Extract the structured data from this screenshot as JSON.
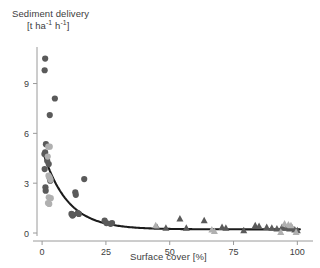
{
  "chart_data": {
    "type": "scatter",
    "title": "Sediment delivery",
    "ylabel_line1": "Sediment delivery",
    "ylabel_line2_prefix": "[t ha",
    "ylabel_line2_mid": " h",
    "ylabel_line2_suffix": "]",
    "ylabel_exponent": "-1",
    "ylabel_full": "[t ha-1 h-1]",
    "xlabel": "Surface cover [%]",
    "xlim": [
      -2,
      103
    ],
    "ylim": [
      -0.55,
      11.2
    ],
    "xticks": [
      0,
      25,
      50,
      75,
      100
    ],
    "xtick_labels": [
      "0",
      "25",
      "50",
      "75",
      "100"
    ],
    "yticks": [
      0,
      3,
      6,
      9
    ],
    "ytick_labels": [
      "0",
      "3",
      "6",
      "9"
    ],
    "grid": false,
    "legend": "none",
    "colors": {
      "marker_dark": "#5a5a5a",
      "marker_light": "#b0b0b0",
      "marker_mid": "#8d8d8d",
      "fit_line": "#1c1c1c",
      "axis": "#9a9a9a",
      "text": "#3d3d3d"
    },
    "series": [
      {
        "name": "dark-circles",
        "marker": "circle",
        "color": "#5a5a5a",
        "points": [
          [
            1.2,
            10.5
          ],
          [
            1.0,
            9.8
          ],
          [
            5.0,
            8.1
          ],
          [
            3.0,
            7.1
          ],
          [
            1.5,
            5.35
          ],
          [
            1.2,
            4.85
          ],
          [
            0.9,
            4.75
          ],
          [
            1.0,
            3.85
          ],
          [
            2.0,
            4.35
          ],
          [
            2.6,
            4.15
          ],
          [
            1.3,
            2.75
          ],
          [
            1.4,
            2.55
          ],
          [
            3.0,
            3.3
          ],
          [
            3.2,
            3.15
          ],
          [
            16.5,
            3.25
          ],
          [
            13.0,
            2.45
          ],
          [
            13.2,
            2.3
          ],
          [
            11.5,
            1.15
          ],
          [
            11.9,
            1.05
          ],
          [
            12.2,
            1.1
          ],
          [
            14.0,
            1.2
          ],
          [
            14.4,
            1.15
          ],
          [
            24.5,
            0.75
          ],
          [
            25.2,
            0.6
          ],
          [
            26.8,
            0.55
          ],
          [
            27.4,
            0.6
          ]
        ]
      },
      {
        "name": "light-circles",
        "marker": "circle",
        "color": "#b0b0b0",
        "points": [
          [
            2.4,
            5.2
          ],
          [
            3.0,
            5.2
          ],
          [
            2.2,
            4.6
          ],
          [
            2.5,
            3.45
          ],
          [
            2.9,
            3.35
          ],
          [
            3.3,
            3.2
          ],
          [
            2.6,
            2.15
          ],
          [
            3.4,
            2.1
          ],
          [
            2.3,
            1.8
          ],
          [
            2.8,
            1.75
          ]
        ]
      },
      {
        "name": "dark-triangles",
        "marker": "triangle",
        "color": "#5a5a5a",
        "points": [
          [
            54.0,
            0.85
          ],
          [
            63.5,
            0.75
          ],
          [
            45.0,
            0.35
          ],
          [
            48.5,
            0.3
          ],
          [
            56.5,
            0.3
          ],
          [
            70.5,
            0.35
          ],
          [
            72.0,
            0.3
          ],
          [
            79.0,
            0.15
          ],
          [
            83.5,
            0.45
          ],
          [
            85.0,
            0.4
          ],
          [
            88.0,
            0.35
          ],
          [
            90.0,
            0.3
          ],
          [
            92.0,
            0.25
          ],
          [
            94.0,
            0.35
          ],
          [
            95.5,
            0.3
          ],
          [
            97.0,
            0.25
          ],
          [
            98.0,
            0.3
          ],
          [
            99.0,
            0.2
          ],
          [
            100.0,
            0.15
          ]
        ]
      },
      {
        "name": "light-triangles",
        "marker": "triangle",
        "color": "#b0b0b0",
        "points": [
          [
            44.5,
            0.45
          ],
          [
            66.5,
            0.2
          ],
          [
            67.5,
            0.1
          ],
          [
            95.0,
            0.55
          ],
          [
            96.5,
            0.5
          ],
          [
            97.5,
            0.45
          ],
          [
            93.5,
            0.05
          ],
          [
            99.5,
            0.05
          ]
        ]
      }
    ],
    "fit_curve": {
      "name": "exponential-decay-fit",
      "color": "#1c1c1c",
      "equation_type": "exponential",
      "a": 4.85,
      "b": 0.105,
      "c": 0.22,
      "x_start": 1.0,
      "x_end": 101.0
    }
  }
}
